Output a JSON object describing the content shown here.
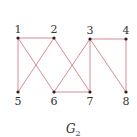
{
  "graph": {
    "caption": "G",
    "caption_sub": "2",
    "edge_color": "#d98a94",
    "node_color": "#222222",
    "nodes": [
      {
        "id": "1",
        "x": 18,
        "y": 38,
        "label_pos": "above"
      },
      {
        "id": "2",
        "x": 54,
        "y": 38,
        "label_pos": "above"
      },
      {
        "id": "3",
        "x": 90,
        "y": 39,
        "label_pos": "above"
      },
      {
        "id": "4",
        "x": 126,
        "y": 39,
        "label_pos": "above"
      },
      {
        "id": "5",
        "x": 18,
        "y": 92,
        "label_pos": "below"
      },
      {
        "id": "6",
        "x": 54,
        "y": 92,
        "label_pos": "below"
      },
      {
        "id": "7",
        "x": 90,
        "y": 92,
        "label_pos": "below"
      },
      {
        "id": "8",
        "x": 126,
        "y": 92,
        "label_pos": "below"
      }
    ],
    "edges": [
      [
        "1",
        "2"
      ],
      [
        "1",
        "5"
      ],
      [
        "1",
        "6"
      ],
      [
        "2",
        "5"
      ],
      [
        "2",
        "7"
      ],
      [
        "3",
        "4"
      ],
      [
        "3",
        "6"
      ],
      [
        "3",
        "7"
      ],
      [
        "3",
        "8"
      ],
      [
        "4",
        "8"
      ],
      [
        "6",
        "7"
      ]
    ]
  }
}
